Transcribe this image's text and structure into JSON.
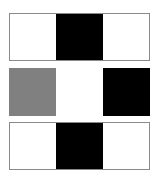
{
  "grid": {
    "rows": [
      {
        "bordered": true,
        "cells": [
          "#ffffff",
          "#000000",
          "#ffffff"
        ]
      },
      {
        "bordered": false,
        "cells": [
          "#808080",
          "#ffffff",
          "#000000"
        ]
      },
      {
        "bordered": true,
        "cells": [
          "#ffffff",
          "#000000",
          "#ffffff"
        ]
      }
    ]
  }
}
